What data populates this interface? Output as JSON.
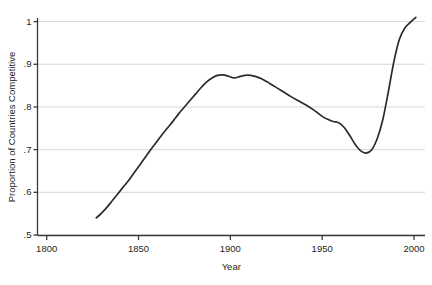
{
  "chart_data": {
    "type": "line",
    "title": "",
    "xlabel": "Year",
    "ylabel": "Proportion of Countries Competitive",
    "xlim": [
      1790,
      2005
    ],
    "ylim": [
      0.5,
      1.02
    ],
    "xticks": [
      1800,
      1850,
      1900,
      1950,
      2000
    ],
    "xtick_labels": [
      "1800",
      "1850",
      "1900",
      "1950",
      "2000"
    ],
    "yticks": [
      0.5,
      0.6,
      0.7,
      0.8,
      0.9,
      1.0
    ],
    "ytick_labels": [
      ".5",
      ".6",
      ".7",
      ".8",
      ".9",
      "1"
    ],
    "grid": "horizontal",
    "legend": "none",
    "line_color": "#2b2b2b",
    "grid_color": "#d8d8d8",
    "axis_color": "#3a3a3a",
    "series": [
      {
        "name": "Proportion of Countries Competitive",
        "x": [
          1827,
          1830,
          1833,
          1836,
          1839,
          1842,
          1845,
          1848,
          1851,
          1854,
          1857,
          1860,
          1863,
          1866,
          1869,
          1872,
          1875,
          1878,
          1881,
          1884,
          1887,
          1890,
          1893,
          1896,
          1899,
          1902,
          1905,
          1908,
          1911,
          1914,
          1917,
          1920,
          1923,
          1926,
          1929,
          1932,
          1935,
          1938,
          1941,
          1944,
          1947,
          1950,
          1953,
          1956,
          1959,
          1962,
          1965,
          1968,
          1971,
          1974,
          1977,
          1980,
          1983,
          1986,
          1989,
          1992,
          1995,
          1998,
          2001
        ],
        "y": [
          0.54,
          0.552,
          0.566,
          0.582,
          0.598,
          0.614,
          0.63,
          0.648,
          0.666,
          0.684,
          0.702,
          0.719,
          0.736,
          0.752,
          0.768,
          0.785,
          0.8,
          0.815,
          0.83,
          0.845,
          0.858,
          0.868,
          0.874,
          0.875,
          0.872,
          0.868,
          0.871,
          0.874,
          0.874,
          0.871,
          0.866,
          0.859,
          0.851,
          0.843,
          0.835,
          0.827,
          0.819,
          0.812,
          0.805,
          0.797,
          0.788,
          0.778,
          0.771,
          0.766,
          0.763,
          0.752,
          0.733,
          0.712,
          0.697,
          0.692,
          0.7,
          0.726,
          0.77,
          0.835,
          0.905,
          0.958,
          0.985,
          0.998,
          1.01
        ]
      }
    ]
  },
  "axes": {
    "ylabel_text": "Proportion of Countries Competitive",
    "xlabel_text": "Year"
  }
}
